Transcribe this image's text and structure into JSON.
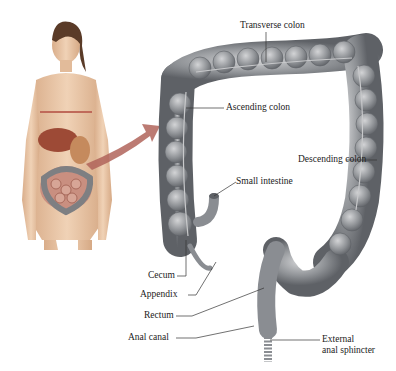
{
  "figure": {
    "labels": {
      "transverse_colon": "Transverse colon",
      "ascending_colon": "Ascending colon",
      "descending_colon": "Descending colon",
      "small_intestine": "Small intestine",
      "cecum": "Cecum",
      "appendix": "Appendix",
      "rectum": "Rectum",
      "anal_canal": "Anal canal",
      "external_anal_sphincter_1": "External",
      "external_anal_sphincter_2": "anal sphincter"
    },
    "colors": {
      "background": "#ffffff",
      "colon": "#8a8d92",
      "colon_light": "#b7b9bc",
      "skin": "#e6c4a5",
      "arrow": "#b0645a",
      "organ_red": "#b85a4a",
      "leader_line": "#333333"
    }
  }
}
